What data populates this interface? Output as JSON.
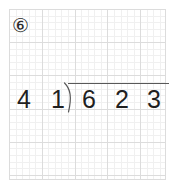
{
  "worksheet": {
    "type": "long-division-problem",
    "background": "#ffffff",
    "grid": {
      "major_line_color": "#dcdcdc",
      "minor_line_color": "#f0f0f0",
      "major_cell_px": 33,
      "minor_cell_px": 6.6,
      "columns": 5,
      "rows": 5
    },
    "problem_number": {
      "label": "⑥",
      "plain": "5",
      "style": "circled-number"
    },
    "problem": {
      "operation": "division",
      "divisor": "41",
      "dividend": "623",
      "divisor_digits": [
        "4",
        "1"
      ],
      "dividend_digits": [
        "6",
        "2",
        "3"
      ],
      "quotient": "",
      "expression": "41 ) 623",
      "ink_color": "#1f1f1f",
      "rule_color": "#585858",
      "bracket_glyph": "division-bracket"
    }
  }
}
